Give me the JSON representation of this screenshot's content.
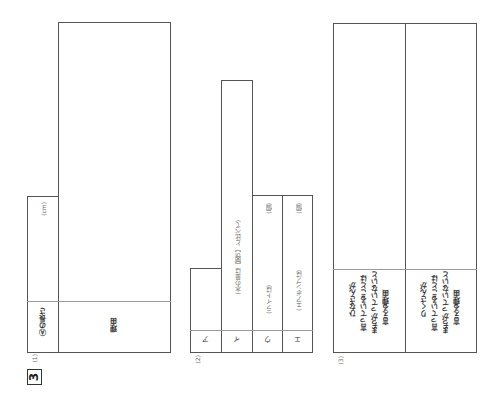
{
  "question": {
    "number": "3"
  },
  "part1": {
    "label": "(1)",
    "length_label": "Ⓐの長さ",
    "unit": "(cm)",
    "reason_label": "理由"
  },
  "part2": {
    "label": "(2)",
    "rows": [
      {
        "key": "ア",
        "prompt": "",
        "unit": ""
      },
      {
        "key": "イ",
        "prompt": "(水の量は【図5】と比べて)",
        "unit": ""
      },
      {
        "key": "ウ",
        "prompt": "(ライトは)",
        "unit": "(個)"
      },
      {
        "key": "エ",
        "prompt": "(エアポンプは)",
        "unit": "(個)"
      }
    ]
  },
  "part3": {
    "label": "(3)",
    "hina_label": [
      "ひなさんが",
      "言っていることは",
      "まちがっていないと",
      "言える理由"
    ],
    "riku_label": [
      "りくさんが",
      "言っていることは",
      "まちがっていないと",
      "言える理由"
    ]
  }
}
